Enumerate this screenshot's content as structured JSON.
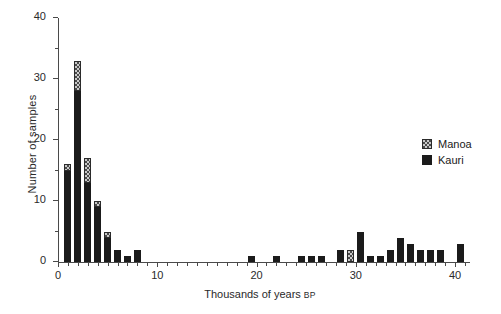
{
  "chart_data": {
    "type": "bar",
    "stacked": true,
    "title": "",
    "xlabel": "Thousands of years BP",
    "xlabel_smallcaps_suffix": "BP",
    "ylabel": "Number of samples",
    "xlim": [
      0,
      41.5
    ],
    "ylim": [
      0,
      40
    ],
    "grid": false,
    "legend_position": "right",
    "x_major_ticks": [
      0,
      10,
      20,
      30,
      40
    ],
    "x_major_tick_labels": [
      "0",
      "10",
      "20",
      "30",
      "40"
    ],
    "x_minor_tick_step": 1,
    "y_major_ticks": [
      0,
      10,
      20,
      30,
      40
    ],
    "y_major_tick_labels": [
      "0",
      "10",
      "20",
      "30",
      "40"
    ],
    "y_minor_ticks": [
      5,
      15,
      25,
      35
    ],
    "x": [
      1,
      2,
      3,
      4,
      5,
      6,
      7,
      8,
      19.5,
      22,
      24.5,
      25.5,
      26.5,
      28.5,
      29.5,
      30.5,
      31.5,
      32.5,
      33.5,
      34.5,
      35.5,
      36.5,
      37.5,
      38.5,
      40.5
    ],
    "categories": [
      "1",
      "2",
      "3",
      "4",
      "5",
      "6",
      "7",
      "8",
      "19.5",
      "22",
      "24.5",
      "25.5",
      "26.5",
      "28.5",
      "29.5",
      "30.5",
      "31.5",
      "32.5",
      "33.5",
      "34.5",
      "35.5",
      "36.5",
      "37.5",
      "38.5",
      "40.5"
    ],
    "series": [
      {
        "name": "Kauri",
        "color": "#1b1b1b",
        "pattern": "solid",
        "values": [
          15,
          28,
          13,
          9,
          4,
          2,
          1,
          2,
          1,
          1,
          1,
          1,
          1,
          2,
          0,
          5,
          1,
          1,
          2,
          4,
          3,
          2,
          2,
          2,
          3
        ]
      },
      {
        "name": "Manoa",
        "color": "#c9c9c9",
        "pattern": "checkered",
        "values": [
          1,
          5,
          4,
          1,
          1,
          0,
          0,
          0,
          0,
          0,
          0,
          0,
          0,
          0,
          2,
          0,
          0,
          0,
          0,
          0,
          0,
          0,
          0,
          0,
          0
        ]
      }
    ],
    "totals": [
      16,
      33,
      17,
      10,
      5,
      2,
      1,
      2,
      1,
      1,
      1,
      1,
      1,
      2,
      2,
      5,
      1,
      1,
      2,
      4,
      3,
      2,
      2,
      2,
      3
    ]
  },
  "legend": {
    "items": [
      {
        "label": "Manoa",
        "swatch": "manoa"
      },
      {
        "label": "Kauri",
        "swatch": "kauri"
      }
    ]
  }
}
